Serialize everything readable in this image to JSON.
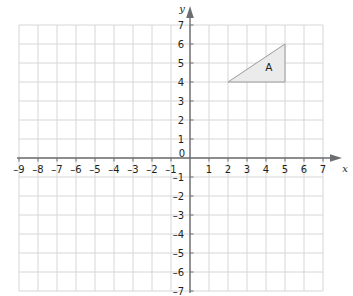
{
  "figure": {
    "type": "coordinate-grid",
    "width": 353,
    "height": 296,
    "background": "#ffffff"
  },
  "chart_data": {
    "type": "scatter",
    "title": "",
    "xlabel": "x",
    "ylabel": "y",
    "xlim": [
      -9,
      7
    ],
    "ylim": [
      -7,
      7
    ],
    "grid": true,
    "grid_step": 1,
    "legend": "none",
    "x_ticks": [
      -9,
      -8,
      -7,
      -6,
      -5,
      -4,
      -3,
      -2,
      -1,
      0,
      1,
      2,
      3,
      4,
      5,
      6,
      7
    ],
    "y_ticks": [
      -7,
      -6,
      -5,
      -4,
      -3,
      -2,
      -1,
      0,
      1,
      2,
      3,
      4,
      5,
      6,
      7
    ],
    "x_tick_labels": [
      "–9",
      "–8",
      "–7",
      "–6",
      "–5",
      "–4",
      "–3",
      "–2",
      "–1",
      "0",
      "1",
      "2",
      "3",
      "4",
      "5",
      "6",
      "7"
    ],
    "y_tick_labels": [
      "–7",
      "–6",
      "–5",
      "–4",
      "–3",
      "–2",
      "–1",
      "0",
      "1",
      "2",
      "3",
      "4",
      "5",
      "6",
      "7"
    ],
    "origin_label": "0",
    "shapes": [
      {
        "name": "A",
        "label": "A",
        "kind": "triangle",
        "vertices": [
          [
            2,
            4
          ],
          [
            5,
            4
          ],
          [
            5,
            6
          ]
        ],
        "label_position": [
          4.15,
          4.75
        ],
        "fill": "#ebebeb",
        "stroke": "#9a9a9a"
      }
    ],
    "colors": {
      "grid_line": "#d6d6d6",
      "axis_line": "#6d6e71",
      "text": "#231f20",
      "shape_fill": "#ebebeb",
      "shape_stroke": "#9a9a9a"
    }
  },
  "axes": {
    "x_axis_name": "x",
    "y_axis_name": "y"
  }
}
